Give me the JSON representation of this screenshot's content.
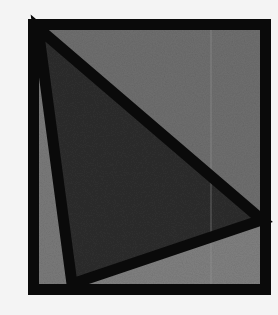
{
  "diagram": {
    "background": "#f4f4f4",
    "frame": {
      "x": 28,
      "y": 19,
      "width": 243,
      "height": 276,
      "stroke": "#0a0a0a",
      "stroke_width": 11
    },
    "regions": [
      {
        "name": "upper-right-region",
        "fill": "#6f6f6f",
        "points": "34,25 265,25 265,220"
      },
      {
        "name": "left-sliver-region",
        "fill": "#7a7a7a",
        "points": "34,25 72,288 34,288"
      },
      {
        "name": "lower-region",
        "fill": "#808080",
        "points": "72,288 265,220 265,288"
      },
      {
        "name": "central-triangle",
        "fill": "#2e2e2e",
        "points": "38,28 262,220 72,284"
      }
    ],
    "triangle": {
      "stroke": "#0a0a0a",
      "stroke_width": 11,
      "points": "38,28 262,220 72,284"
    },
    "divider_line": {
      "x": 211,
      "y1": 25,
      "y2": 289,
      "color": "#9a9a9a"
    }
  }
}
